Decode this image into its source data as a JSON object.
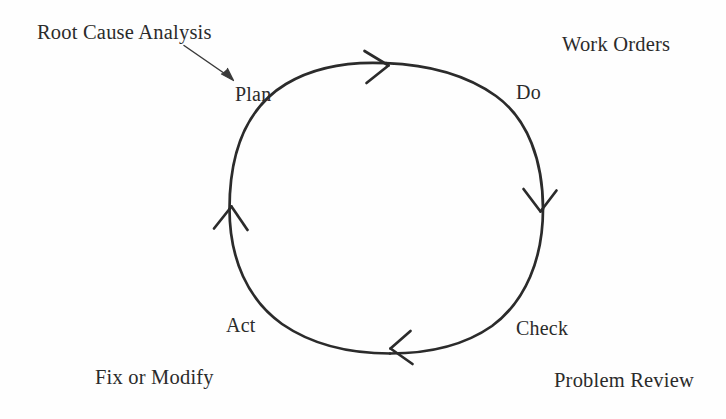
{
  "diagram": {
    "title_present": false,
    "type": "pdca-cycle",
    "background_color": "#fefefe",
    "stroke_color": "#2b2b2b",
    "text_color": "#2b2b2b",
    "cycle": {
      "center_x": 386,
      "center_y": 208,
      "radius_x": 157,
      "radius_y": 145,
      "direction": "clockwise"
    },
    "phases": [
      {
        "id": "plan",
        "label": "Plan",
        "position": "top-left"
      },
      {
        "id": "do",
        "label": "Do",
        "position": "top-right"
      },
      {
        "id": "check",
        "label": "Check",
        "position": "bottom-right"
      },
      {
        "id": "act",
        "label": "Act",
        "position": "bottom-left"
      }
    ],
    "annotations": [
      {
        "id": "root-cause-analysis",
        "label": "Root Cause Analysis",
        "position": "top-left",
        "has_pointer_arrow": true,
        "points_to": "plan"
      },
      {
        "id": "work-orders",
        "label": "Work Orders",
        "position": "top-right",
        "has_pointer_arrow": false,
        "points_to": "do"
      },
      {
        "id": "problem-review",
        "label": "Problem Review",
        "position": "bottom-right",
        "has_pointer_arrow": false,
        "points_to": "check"
      },
      {
        "id": "fix-or-modify",
        "label": "Fix or Modify",
        "position": "bottom-left",
        "has_pointer_arrow": false,
        "points_to": "act"
      }
    ],
    "arrowheads": [
      {
        "id": "arrowhead-top",
        "x": 385,
        "y": 63,
        "direction": "right"
      },
      {
        "id": "arrowhead-right",
        "x": 540,
        "y": 200,
        "direction": "down"
      },
      {
        "id": "arrowhead-bottom",
        "x": 395,
        "y": 350,
        "direction": "left"
      },
      {
        "id": "arrowhead-left",
        "x": 230,
        "y": 212,
        "direction": "up"
      }
    ],
    "pointer_arrow": {
      "id": "rca-pointer",
      "from_x": 184,
      "from_y": 45,
      "to_x": 234,
      "to_y": 80
    }
  }
}
